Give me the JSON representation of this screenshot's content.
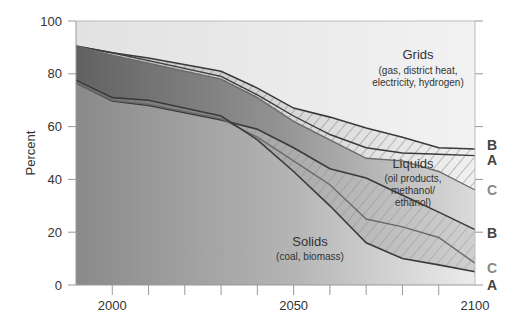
{
  "chart_data": {
    "type": "area",
    "title": "",
    "xlabel": "",
    "ylabel": "Percent",
    "xlim": [
      1990,
      2100
    ],
    "ylim": [
      0,
      100
    ],
    "x_ticks": [
      2000,
      2050,
      2100
    ],
    "x_minor_ticks": [
      2000,
      2010,
      2020,
      2030,
      2040,
      2050,
      2060,
      2070,
      2080,
      2090
    ],
    "y_ticks": [
      0,
      20,
      40,
      60,
      80,
      100
    ],
    "grid": false,
    "x": [
      1990,
      2000,
      2010,
      2030,
      2040,
      2050,
      2060,
      2070,
      2080,
      2090,
      2100
    ],
    "regions": [
      {
        "name": "Grids",
        "subtitle_lines": [
          "(gas, district heat,",
          "electricity, hydrogen)"
        ]
      },
      {
        "name": "Liquids",
        "subtitle_lines": [
          "(oil products,",
          "methanol/",
          "ethanol)"
        ]
      },
      {
        "name": "Solids",
        "subtitle_lines": [
          "(coal, biomass)"
        ]
      }
    ],
    "series": [
      {
        "name": "Grids/Liquids boundary B",
        "scenario": "B",
        "values": [
          90.5,
          88,
          86,
          81,
          74.6,
          67,
          63.6,
          59.5,
          56,
          52,
          51.5
        ]
      },
      {
        "name": "Grids/Liquids boundary A",
        "scenario": "A",
        "values": [
          90.5,
          88,
          85,
          79,
          72,
          64,
          57,
          52,
          50,
          49.5,
          49
        ]
      },
      {
        "name": "Grids/Liquids boundary C",
        "scenario": "C",
        "values": [
          90.5,
          87,
          84,
          78,
          71,
          62,
          55,
          48,
          47,
          43,
          36
        ]
      },
      {
        "name": "Liquids/Solids boundary B",
        "scenario": "B",
        "values": [
          76.5,
          69.7,
          68,
          62.5,
          59,
          52,
          44,
          40.5,
          34,
          27.6,
          21
        ]
      },
      {
        "name": "Liquids/Solids boundary C",
        "scenario": "C",
        "values": [
          76.5,
          70,
          68.5,
          63,
          56,
          47,
          38,
          25,
          22,
          18,
          8.3
        ]
      },
      {
        "name": "Liquids/Solids boundary A",
        "scenario": "A",
        "values": [
          77.6,
          71,
          70,
          64,
          55,
          43,
          30,
          16,
          10,
          7.6,
          5
        ]
      }
    ],
    "right_labels": [
      {
        "text": "B",
        "y": 51.5
      },
      {
        "text": "A",
        "y": 48
      },
      {
        "text": "C",
        "y": 36
      },
      {
        "text": "B",
        "y": 21
      },
      {
        "text": "C",
        "y": 8
      },
      {
        "text": "A",
        "y": 2
      }
    ]
  }
}
